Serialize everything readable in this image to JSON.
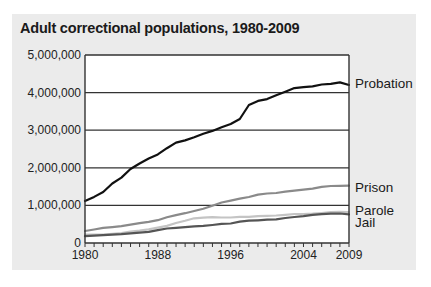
{
  "chart_data": {
    "type": "line",
    "title": "Adult correctional populations, 1980-2009",
    "xlabel": "",
    "ylabel": "",
    "x": [
      1980,
      1981,
      1982,
      1983,
      1984,
      1985,
      1986,
      1987,
      1988,
      1989,
      1990,
      1991,
      1992,
      1993,
      1994,
      1995,
      1996,
      1997,
      1998,
      1999,
      2000,
      2001,
      2002,
      2003,
      2004,
      2005,
      2006,
      2007,
      2008,
      2009
    ],
    "xlim": [
      1980,
      2009
    ],
    "ylim": [
      0,
      5000000
    ],
    "x_ticks": [
      "1980",
      "1988",
      "1996",
      "2004",
      "2009"
    ],
    "x_tick_values": [
      1980,
      1988,
      1996,
      2004,
      2009
    ],
    "y_ticks": [
      "0",
      "1,000,000",
      "2,000,000",
      "3,000,000",
      "4,000,000",
      "5,000,000"
    ],
    "y_tick_values": [
      0,
      1000000,
      2000000,
      3000000,
      4000000,
      5000000
    ],
    "grid": true,
    "legend_position": "inline-right",
    "series": [
      {
        "name": "Probation",
        "color": "#111111",
        "width": 2.2,
        "values": [
          1118000,
          1225000,
          1357000,
          1582000,
          1740000,
          1969000,
          2114000,
          2247000,
          2356000,
          2522000,
          2670000,
          2729000,
          2812000,
          2903000,
          2981000,
          3078000,
          3165000,
          3297000,
          3670000,
          3780000,
          3826000,
          3932000,
          4024000,
          4120000,
          4143000,
          4166000,
          4215000,
          4234000,
          4270000,
          4203000
        ]
      },
      {
        "name": "Prison",
        "color": "#8a8a8a",
        "width": 2.2,
        "values": [
          320000,
          360000,
          403000,
          423000,
          448000,
          488000,
          527000,
          560000,
          607000,
          684000,
          743000,
          793000,
          851000,
          909000,
          990000,
          1078000,
          1128000,
          1177000,
          1224000,
          1287000,
          1316000,
          1331000,
          1367000,
          1392000,
          1421000,
          1448000,
          1492000,
          1517000,
          1518000,
          1524000
        ]
      },
      {
        "name": "Parole",
        "color": "#c4c4c4",
        "width": 2.2,
        "values": [
          220000,
          226000,
          224000,
          246000,
          266000,
          300000,
          326000,
          362000,
          407000,
          456000,
          531000,
          590000,
          658000,
          676000,
          690000,
          679000,
          679000,
          695000,
          696000,
          714000,
          723000,
          732000,
          750000,
          770000,
          771000,
          780000,
          799000,
          821000,
          828000,
          819000
        ]
      },
      {
        "name": "Jail",
        "color": "#555555",
        "width": 2.2,
        "values": [
          182000,
          196000,
          209000,
          224000,
          234000,
          256000,
          274000,
          296000,
          341000,
          386000,
          403000,
          424000,
          441000,
          455000,
          479000,
          507000,
          518000,
          567000,
          592000,
          605000,
          621000,
          631000,
          665000,
          691000,
          713000,
          747000,
          766000,
          780000,
          785000,
          760000
        ]
      }
    ],
    "series_labels": [
      {
        "name": "Probation",
        "y_value": 4250000
      },
      {
        "name": "Prison",
        "y_value": 1480000
      },
      {
        "name": "Parole",
        "y_value": 880000
      },
      {
        "name": "Jail",
        "y_value": 550000
      }
    ]
  },
  "style": {
    "panel_bg": "#ebebeb",
    "plot_bg": "#ffffff",
    "grid_color": "#333333",
    "axis_color": "#333333"
  }
}
